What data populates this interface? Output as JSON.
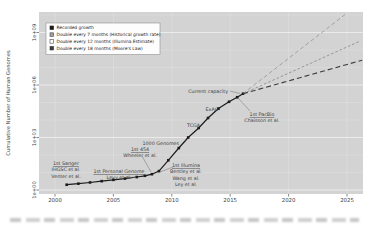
{
  "figure": {
    "background": "#ffffff",
    "panel_color": "#d3d3d3",
    "grid_color": "#ffffff",
    "text_color": "#3f3f3f",
    "tick_color": "#333333"
  },
  "y_axis": {
    "title": "Cumulative Number of Human Genomes",
    "tick_labels": [
      "1e+00",
      "1e+03",
      "1e+06",
      "1e+09"
    ]
  },
  "x_axis": {
    "tick_labels": [
      "2000",
      "2005",
      "2010",
      "2015",
      "2020",
      "2025"
    ]
  },
  "legend": {
    "items": [
      {
        "label": "Recorded growth",
        "marker": "filled-black-square",
        "fill": "#1c1c1c",
        "stroke": "#1c1c1c"
      },
      {
        "label": "Double every 7 months (Historical growth rate)",
        "marker": "filled-gray-square",
        "fill": "#9e9e9e",
        "stroke": "#4a4a4a"
      },
      {
        "label": "Double every 12 months (Illumina Estimate)",
        "marker": "open-square",
        "fill": "#ffffff",
        "stroke": "#4a4a4a"
      },
      {
        "label": "Double every 18 months (Moore's Law)",
        "marker": "filled-dark-square",
        "fill": "#3d3d3d",
        "stroke": "#3d3d3d"
      }
    ]
  },
  "chart_data": {
    "type": "line",
    "title": "",
    "xlabel": "",
    "ylabel": "Cumulative Number of Human Genomes",
    "y_scale": "log10",
    "grid": true,
    "legend_position": "top-left",
    "x_ticks": [
      2000,
      2005,
      2010,
      2015,
      2020,
      2025
    ],
    "y_ticks": [
      1,
      1000,
      1000000,
      1000000000
    ],
    "y_tick_labels": [
      "1e+00",
      "1e+03",
      "1e+06",
      "1e+09"
    ],
    "x_range": [
      1998.6,
      2026.4
    ],
    "y_range_log": [
      -0.23,
      10.17
    ],
    "series": [
      {
        "name": "Recorded growth",
        "style": "solid",
        "color": "#1c1c1c",
        "width": 1.2,
        "marker": "square",
        "points": [
          [
            2001,
            2
          ],
          [
            2002,
            2.3
          ],
          [
            2003,
            2.7
          ],
          [
            2004,
            3.2
          ],
          [
            2005,
            3.8
          ],
          [
            2006,
            4.5
          ],
          [
            2007,
            5.5
          ],
          [
            2007.7,
            6.5
          ],
          [
            2008.3,
            8
          ],
          [
            2008.9,
            12
          ],
          [
            2009.7,
            50
          ],
          [
            2010.6,
            250
          ],
          [
            2011.4,
            1000
          ],
          [
            2012.3,
            3500
          ],
          [
            2013.1,
            13000
          ],
          [
            2014,
            45000
          ],
          [
            2014.9,
            110000
          ],
          [
            2015.6,
            200000
          ],
          [
            2016.1,
            320000
          ]
        ]
      },
      {
        "name": "Double every 7 months (Historical growth rate)",
        "style": "dashed",
        "color": "#a3a3a3",
        "width": 1.0,
        "dash": "4,2.6",
        "marker": "none",
        "points": [
          [
            2016.1,
            320000
          ],
          [
            2025,
            13000000000
          ]
        ]
      },
      {
        "name": "Double every 12 months (Illumina Estimate)",
        "style": "dashed",
        "color": "#8f8f8f",
        "width": 0.9,
        "dash": "2.6,2",
        "marker": "none",
        "points": [
          [
            2016.1,
            320000
          ],
          [
            2026,
            300000000
          ]
        ]
      },
      {
        "name": "Double every 18 months (Moore's Law)",
        "style": "dashed",
        "color": "#3d3d3d",
        "width": 1.1,
        "dash": "5,3",
        "marker": "none",
        "points": [
          [
            2016.1,
            320000
          ],
          [
            2026.3,
            26000000
          ]
        ]
      }
    ],
    "annotations": [
      {
        "lines": [
          "1st Sanger",
          "IHGSC et al.",
          "Venter et al."
        ],
        "underline_first": true,
        "align": "center",
        "px": [
          66,
          161
        ],
        "leader": null
      },
      {
        "lines": [
          "1st Personal Genome",
          "Levy et al."
        ],
        "underline_first": true,
        "align": "center",
        "px": [
          119,
          169
        ],
        "leader": [
          [
            127,
            177
          ],
          [
            136,
            177.5
          ]
        ]
      },
      {
        "lines": [
          "1st 454",
          "Wheeler et al."
        ],
        "underline_first": true,
        "align": "center",
        "px": [
          140,
          147
        ],
        "leader": [
          [
            142,
            156
          ],
          [
            151,
            172
          ]
        ]
      },
      {
        "lines": [
          "1st Illumina",
          "Bentley et al.",
          "Wang et al.",
          "Ley et al."
        ],
        "underline_first": true,
        "align": "center",
        "px": [
          186,
          163
        ],
        "leader": [
          [
            173,
            167
          ],
          [
            160,
            172
          ]
        ]
      },
      {
        "lines": [
          "1000 Genomes"
        ],
        "underline_first": false,
        "align": "right",
        "px": [
          179,
          141
        ],
        "leader": null
      },
      {
        "lines": [
          "TCGA"
        ],
        "underline_first": false,
        "align": "right",
        "px": [
          200,
          123
        ],
        "leader": null
      },
      {
        "lines": [
          "ExAC"
        ],
        "underline_first": false,
        "align": "right",
        "px": [
          218,
          107
        ],
        "leader": null
      },
      {
        "lines": [
          "Current capacity"
        ],
        "underline_first": false,
        "align": "right",
        "px": [
          228,
          89
        ],
        "leader": [
          [
            230,
            91
          ],
          [
            240,
            93.5
          ]
        ]
      },
      {
        "lines": [
          "1st PacBio",
          "Chaisson et al."
        ],
        "underline_first": true,
        "align": "center",
        "px": [
          262,
          112
        ],
        "leader": [
          [
            250,
            111
          ],
          [
            238,
            98
          ]
        ]
      }
    ]
  }
}
